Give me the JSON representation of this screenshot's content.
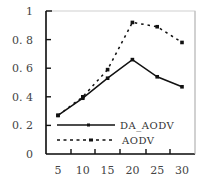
{
  "chart_data": {
    "type": "line",
    "title": "",
    "xlabel": "",
    "ylabel": "",
    "x": [
      5,
      10,
      15,
      20,
      25,
      30
    ],
    "x_tick_labels": [
      "5",
      "10",
      "15",
      "20",
      "25",
      "30"
    ],
    "y_tick_labels": [
      "0",
      "0. 2",
      "0. 4",
      "0. 6",
      "0. 8",
      "1"
    ],
    "ylim": [
      0,
      1
    ],
    "grid": false,
    "legend_position": "lower-left inside",
    "series": [
      {
        "name": "DA_AODV",
        "style": "solid",
        "color": "#111111",
        "values": [
          0.27,
          0.39,
          0.53,
          0.66,
          0.54,
          0.47
        ]
      },
      {
        "name": "AODV",
        "style": "dashed",
        "color": "#111111",
        "values": [
          0.27,
          0.4,
          0.59,
          0.92,
          0.89,
          0.78
        ]
      }
    ]
  },
  "legend": {
    "items": [
      {
        "label": "DA_AODV"
      },
      {
        "label": "AODV"
      }
    ]
  }
}
